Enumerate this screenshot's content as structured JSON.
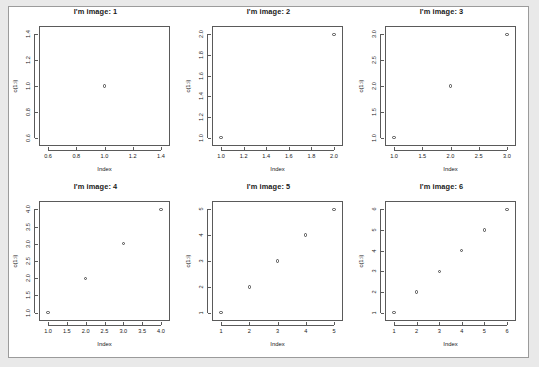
{
  "page": {
    "background_color": "#e9e9e9",
    "device_background_color": "#ffffff",
    "device_border_color": "#9b9b9b",
    "layout": "2 rows x 3 columns of scatterplots"
  },
  "chart_data": [
    {
      "type": "scatter",
      "title": "I'm image: 1",
      "xlabel": "Index",
      "ylabel": "c(1:i)",
      "x": [
        1
      ],
      "y": [
        1
      ],
      "xlim": [
        0.6,
        1.4
      ],
      "ylim": [
        0.6,
        1.4
      ],
      "xticks": [
        "0.6",
        "0.8",
        "1.0",
        "1.2",
        "1.4"
      ],
      "xtickvals": [
        0.6,
        0.8,
        1.0,
        1.2,
        1.4
      ],
      "yticks": [
        "0.6",
        "0.8",
        "1.0",
        "1.2",
        "1.4"
      ],
      "ytickvals": [
        0.6,
        0.8,
        1.0,
        1.2,
        1.4
      ],
      "grid": false,
      "legend": "none",
      "marker": "open-circle"
    },
    {
      "type": "scatter",
      "title": "I'm image: 2",
      "xlabel": "Index",
      "ylabel": "c(1:i)",
      "x": [
        1,
        2
      ],
      "y": [
        1,
        2
      ],
      "xlim": [
        1.0,
        2.0
      ],
      "ylim": [
        1.0,
        2.0
      ],
      "xticks": [
        "1.0",
        "1.2",
        "1.4",
        "1.6",
        "1.8",
        "2.0"
      ],
      "xtickvals": [
        1.0,
        1.2,
        1.4,
        1.6,
        1.8,
        2.0
      ],
      "yticks": [
        "1.0",
        "1.2",
        "1.4",
        "1.6",
        "1.8",
        "2.0"
      ],
      "ytickvals": [
        1.0,
        1.2,
        1.4,
        1.6,
        1.8,
        2.0
      ],
      "grid": false,
      "legend": "none",
      "marker": "open-circle"
    },
    {
      "type": "scatter",
      "title": "I'm image: 3",
      "xlabel": "Index",
      "ylabel": "c(1:i)",
      "x": [
        1,
        2,
        3
      ],
      "y": [
        1,
        2,
        3
      ],
      "xlim": [
        1.0,
        3.0
      ],
      "ylim": [
        1.0,
        3.0
      ],
      "xticks": [
        "1.0",
        "1.5",
        "2.0",
        "2.5",
        "3.0"
      ],
      "xtickvals": [
        1.0,
        1.5,
        2.0,
        2.5,
        3.0
      ],
      "yticks": [
        "1.0",
        "1.5",
        "2.0",
        "2.5",
        "3.0"
      ],
      "ytickvals": [
        1.0,
        1.5,
        2.0,
        2.5,
        3.0
      ],
      "grid": false,
      "legend": "none",
      "marker": "open-circle"
    },
    {
      "type": "scatter",
      "title": "I'm image: 4",
      "xlabel": "Index",
      "ylabel": "c(1:i)",
      "x": [
        1,
        2,
        3,
        4
      ],
      "y": [
        1,
        2,
        3,
        4
      ],
      "xlim": [
        1.0,
        4.0
      ],
      "ylim": [
        1.0,
        4.0
      ],
      "xticks": [
        "1.0",
        "1.5",
        "2.0",
        "2.5",
        "3.0",
        "3.5",
        "4.0"
      ],
      "xtickvals": [
        1.0,
        1.5,
        2.0,
        2.5,
        3.0,
        3.5,
        4.0
      ],
      "yticks": [
        "1.0",
        "1.5",
        "2.0",
        "2.5",
        "3.0",
        "3.5",
        "4.0"
      ],
      "ytickvals": [
        1.0,
        1.5,
        2.0,
        2.5,
        3.0,
        3.5,
        4.0
      ],
      "grid": false,
      "legend": "none",
      "marker": "open-circle"
    },
    {
      "type": "scatter",
      "title": "I'm image: 5",
      "xlabel": "Index",
      "ylabel": "c(1:i)",
      "x": [
        1,
        2,
        3,
        4,
        5
      ],
      "y": [
        1,
        2,
        3,
        4,
        5
      ],
      "xlim": [
        1,
        5
      ],
      "ylim": [
        1,
        5
      ],
      "xticks": [
        "1",
        "2",
        "3",
        "4",
        "5"
      ],
      "xtickvals": [
        1,
        2,
        3,
        4,
        5
      ],
      "yticks": [
        "1",
        "2",
        "3",
        "4",
        "5"
      ],
      "ytickvals": [
        1,
        2,
        3,
        4,
        5
      ],
      "grid": false,
      "legend": "none",
      "marker": "open-circle"
    },
    {
      "type": "scatter",
      "title": "I'm image: 6",
      "xlabel": "Index",
      "ylabel": "c(1:i)",
      "x": [
        1,
        2,
        3,
        4,
        5,
        6
      ],
      "y": [
        1,
        2,
        3,
        4,
        5,
        6
      ],
      "xlim": [
        1,
        6
      ],
      "ylim": [
        1,
        6
      ],
      "xticks": [
        "1",
        "2",
        "3",
        "4",
        "5",
        "6"
      ],
      "xtickvals": [
        1,
        2,
        3,
        4,
        5,
        6
      ],
      "yticks": [
        "1",
        "2",
        "3",
        "4",
        "5",
        "6"
      ],
      "ytickvals": [
        1,
        2,
        3,
        4,
        5,
        6
      ],
      "grid": false,
      "legend": "none",
      "marker": "open-circle"
    }
  ]
}
